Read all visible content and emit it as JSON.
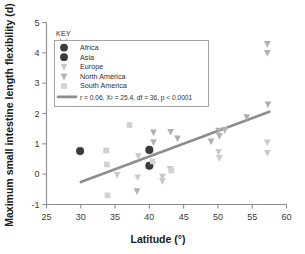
{
  "chart_data": {
    "type": "scatter",
    "title": "",
    "xlabel": "Latitude (°)",
    "ylabel": "Maximum small intestine length flexibility (d)",
    "xlim": [
      25,
      60
    ],
    "ylim": [
      -1,
      5
    ],
    "xticks": [
      25,
      30,
      35,
      40,
      45,
      50,
      55,
      60
    ],
    "yticks": [
      -1,
      0,
      1,
      2,
      3,
      4,
      5
    ],
    "xtick_labels": [
      "25",
      "30",
      "35",
      "40",
      "45",
      "50",
      "55",
      "60"
    ],
    "ytick_labels": [
      "-1",
      "0",
      "1",
      "2",
      "3",
      "4",
      "5"
    ],
    "grid": false,
    "legend_position": "upper-left",
    "legend_title": "KEY",
    "series": [
      {
        "name": "Africa",
        "marker": "circle",
        "color": "#3b3b3b",
        "points": [
          [
            29.9,
            0.76
          ]
        ]
      },
      {
        "name": "Asia",
        "marker": "circle",
        "color": "#3b3b3b",
        "points": [
          [
            40.0,
            0.8
          ],
          [
            40.0,
            0.28
          ]
        ]
      },
      {
        "name": "Europe",
        "marker": "triangle-down",
        "color": "#c9c9c9",
        "points": [
          [
            35.3,
            -0.02
          ],
          [
            38.3,
            -0.1
          ],
          [
            38.4,
            0.6
          ],
          [
            41.9,
            -0.08
          ],
          [
            41.9,
            -0.22
          ],
          [
            43.0,
            0.18
          ],
          [
            50.1,
            0.74
          ],
          [
            50.2,
            0.54
          ],
          [
            57.2,
            1.05
          ],
          [
            57.2,
            0.7
          ]
        ]
      },
      {
        "name": "North America",
        "marker": "triangle-down",
        "color": "#b0b0b0",
        "points": [
          [
            38.2,
            -0.56
          ],
          [
            40.6,
            1.38
          ],
          [
            40.6,
            1.06
          ],
          [
            43.1,
            1.4
          ],
          [
            44.1,
            1.18
          ],
          [
            49.0,
            1.08
          ],
          [
            50.1,
            1.44
          ],
          [
            50.2,
            1.26
          ],
          [
            51.0,
            1.46
          ],
          [
            54.2,
            1.88
          ],
          [
            57.2,
            4.3
          ],
          [
            57.2,
            4.0
          ],
          [
            57.3,
            2.3
          ]
        ]
      },
      {
        "name": "South America",
        "marker": "square",
        "color": "#d2d2d2",
        "points": [
          [
            33.7,
            0.78
          ],
          [
            33.8,
            0.32
          ],
          [
            33.9,
            -0.7
          ],
          [
            37.1,
            1.62
          ],
          [
            40.5,
            0.42
          ],
          [
            43.2,
            0.12
          ]
        ]
      }
    ],
    "fit_line": {
      "label": "r = 0.06, X² = 25.4, df = 36, p < 0.0001",
      "color": "#8e8e8e",
      "x_start": 30.0,
      "y_start": -0.26,
      "x_end": 57.5,
      "y_end": 2.06
    }
  },
  "legend": {
    "title": "KEY",
    "entries": [
      {
        "label": "Africa"
      },
      {
        "label": "Asia"
      },
      {
        "label": "Europe"
      },
      {
        "label": "North America"
      },
      {
        "label": "South America"
      },
      {
        "label": "r = 0.06, X² = 25.4, df = 36, p < 0.0001"
      }
    ]
  }
}
